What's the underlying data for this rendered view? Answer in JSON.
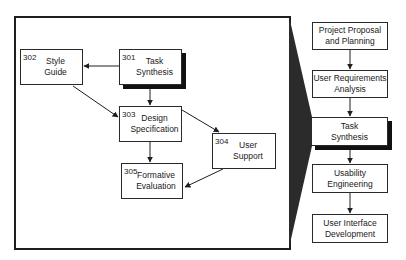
{
  "left_panel": {
    "boxes": [
      {
        "id": "301",
        "number": "301",
        "line1": "Task",
        "line2": "Synthesis",
        "emphasized": true
      },
      {
        "id": "302",
        "number": "302",
        "line1": "Style",
        "line2": "Guide",
        "emphasized": false
      },
      {
        "id": "303",
        "number": "303",
        "line1": "Design",
        "line2": "Specification",
        "emphasized": false
      },
      {
        "id": "304",
        "number": "304",
        "line1": "User",
        "line2": "Support",
        "emphasized": false
      },
      {
        "id": "305",
        "number": "305",
        "line1": "Formative",
        "line2": "Evaluation",
        "emphasized": false
      }
    ],
    "edges": [
      {
        "from": "301",
        "to": "302"
      },
      {
        "from": "301",
        "to": "303"
      },
      {
        "from": "302",
        "to": "303"
      },
      {
        "from": "303",
        "to": "304"
      },
      {
        "from": "303",
        "to": "305"
      },
      {
        "from": "304",
        "to": "305"
      }
    ]
  },
  "right_panel": {
    "steps": [
      {
        "line1": "Project Proposal",
        "line2": "and Planning",
        "emphasized": false
      },
      {
        "line1": "User Requirements",
        "line2": "Analysis",
        "emphasized": false
      },
      {
        "line1": "Task",
        "line2": "Synthesis",
        "emphasized": true
      },
      {
        "line1": "Usability",
        "line2": "Engineering",
        "emphasized": false
      },
      {
        "line1": "User Interface",
        "line2": "Development",
        "emphasized": false
      }
    ]
  },
  "colors": {
    "line": "#1e1e1e",
    "shadow": "#111111",
    "wedge": "#2b2b2b",
    "background": "#ffffff"
  }
}
